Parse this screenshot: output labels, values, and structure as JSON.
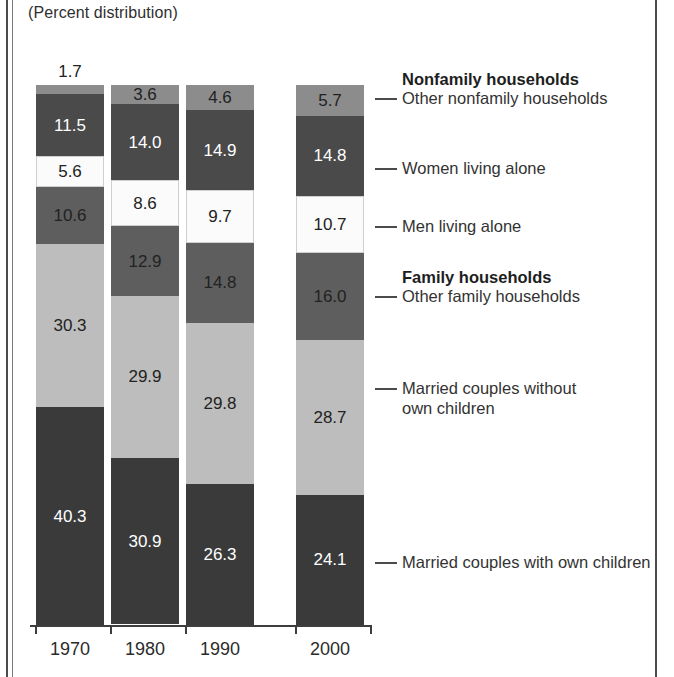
{
  "caption": "(Percent distribution)",
  "chart_data": {
    "type": "bar",
    "subtype": "stacked-bar-100",
    "title": "",
    "subtitle": "(Percent distribution)",
    "xlabel": "",
    "ylabel": "",
    "ylim": [
      0,
      100
    ],
    "grid": false,
    "legend_position": "right-leader-lines",
    "categories": [
      "1970",
      "1980",
      "1990",
      "2000"
    ],
    "stack_order_top_to_bottom": [
      "Other nonfamily households",
      "Women living alone",
      "Men living alone",
      "Other family households",
      "Married couples without own children",
      "Married couples with own children"
    ],
    "series": [
      {
        "name": "Other nonfamily households",
        "group": "Nonfamily households",
        "color": "#8c8c8c",
        "label_color": "#222222",
        "values": [
          1.7,
          3.6,
          4.6,
          5.7
        ]
      },
      {
        "name": "Women living alone",
        "group": "Nonfamily households",
        "color": "#4a4a4a",
        "label_color": "#ffffff",
        "values": [
          11.5,
          14.0,
          14.9,
          14.8
        ]
      },
      {
        "name": "Men living alone",
        "group": "Nonfamily households",
        "color": "#fbfbfb",
        "label_color": "#222222",
        "values": [
          5.6,
          8.6,
          9.7,
          10.7
        ]
      },
      {
        "name": "Other family households",
        "group": "Family households",
        "color": "#5e5e5e",
        "label_color": "#222222",
        "values": [
          10.6,
          12.9,
          14.8,
          16.0
        ]
      },
      {
        "name": "Married couples without own children",
        "group": "Family households",
        "color": "#bdbdbd",
        "label_color": "#222222",
        "values": [
          30.3,
          29.9,
          29.8,
          28.7
        ]
      },
      {
        "name": "Married couples with own children",
        "group": "Family households",
        "color": "#3a3a3a",
        "label_color": "#ffffff",
        "values": [
          40.3,
          30.9,
          26.3,
          24.1
        ]
      }
    ]
  },
  "bars": [
    {
      "year": "1970",
      "segments": [
        {
          "value": "1.7",
          "label_outside": true
        },
        {
          "value": "11.5",
          "label_outside": false
        },
        {
          "value": "5.6",
          "label_outside": false
        },
        {
          "value": "10.6",
          "label_outside": false
        },
        {
          "value": "30.3",
          "label_outside": false
        },
        {
          "value": "40.3",
          "label_outside": false
        }
      ]
    },
    {
      "year": "1980",
      "segments": [
        {
          "value": "3.6",
          "label_outside": false
        },
        {
          "value": "14.0",
          "label_outside": false
        },
        {
          "value": "8.6",
          "label_outside": false
        },
        {
          "value": "12.9",
          "label_outside": false
        },
        {
          "value": "29.9",
          "label_outside": false
        },
        {
          "value": "30.9",
          "label_outside": false
        }
      ]
    },
    {
      "year": "1990",
      "segments": [
        {
          "value": "4.6",
          "label_outside": false
        },
        {
          "value": "14.9",
          "label_outside": false
        },
        {
          "value": "9.7",
          "label_outside": false
        },
        {
          "value": "14.8",
          "label_outside": false
        },
        {
          "value": "29.8",
          "label_outside": false
        },
        {
          "value": "26.3",
          "label_outside": false
        }
      ]
    },
    {
      "year": "2000",
      "segments": [
        {
          "value": "5.7",
          "label_outside": false
        },
        {
          "value": "14.8",
          "label_outside": false
        },
        {
          "value": "10.7",
          "label_outside": false
        },
        {
          "value": "16.0",
          "label_outside": false
        },
        {
          "value": "28.7",
          "label_outside": false
        },
        {
          "value": "24.1",
          "label_outside": false
        }
      ]
    }
  ],
  "legend": {
    "headings": [
      {
        "text": "Nonfamily households"
      },
      {
        "text": "Family households"
      }
    ],
    "items": [
      {
        "text": "Other nonfamily households"
      },
      {
        "text": "Women living alone"
      },
      {
        "text": "Men living alone"
      },
      {
        "text": "Other family households"
      },
      {
        "text": "Married couples without\nown children"
      },
      {
        "text": "Married couples with own children"
      }
    ]
  }
}
